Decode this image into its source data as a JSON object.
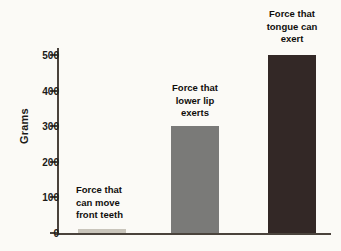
{
  "chart_data": {
    "type": "bar",
    "title": "",
    "subtitle": "",
    "xlabel": "",
    "ylabel": "Grams",
    "ylim": [
      0,
      500
    ],
    "grid": false,
    "legend": "none",
    "orientation": "vertical",
    "background_color": "#fbfaf6",
    "axis_color": "#4a433c",
    "categories": [
      "Force that can move front teeth",
      "Force that lower lip exerts",
      "Force that tongue can exert"
    ],
    "values": [
      10,
      300,
      500
    ],
    "bar_colors": [
      "#c9c5bb",
      "#7a7a78",
      "#332826"
    ],
    "y_ticks": [
      0,
      100,
      200,
      300,
      400,
      500
    ],
    "y_tick_labels": [
      "0",
      "100",
      "200",
      "300",
      "400",
      "500"
    ],
    "annotations": [
      {
        "text": "Force that\ncan move\nfront teeth",
        "value": 10,
        "align": "left"
      },
      {
        "text": "Force that\nlower lip\nexerts",
        "value": 300,
        "align": "center"
      },
      {
        "text": "Force that\ntongue can\nexert",
        "value": 500,
        "align": "center"
      }
    ]
  }
}
